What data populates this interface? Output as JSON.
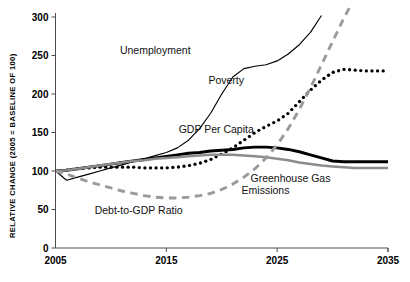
{
  "chart_data": {
    "type": "line",
    "title": "",
    "xlabel": "",
    "ylabel": "RELATIVE CHANGE (2005 = BASELINE OF 100)",
    "xlim": [
      2005,
      2035
    ],
    "ylim": [
      0,
      310
    ],
    "xticks": [
      "2005",
      "2015",
      "2025",
      "2035"
    ],
    "xtick_values": [
      2005,
      2015,
      2025,
      2035
    ],
    "yticks": [
      "0",
      "50",
      "100",
      "150",
      "200",
      "250",
      "300"
    ],
    "ytick_values": [
      0,
      50,
      100,
      150,
      200,
      250,
      300
    ],
    "grid": false,
    "legend": "inline-labels",
    "x": [
      2005,
      2006,
      2007,
      2008,
      2009,
      2010,
      2011,
      2012,
      2013,
      2014,
      2015,
      2016,
      2017,
      2018,
      2019,
      2020,
      2021,
      2022,
      2023,
      2024,
      2025,
      2026,
      2027,
      2028,
      2029,
      2030,
      2031,
      2032,
      2033,
      2034,
      2035
    ],
    "series": [
      {
        "name": "Unemployment",
        "style": "thin-solid",
        "color": "#000000",
        "label_x": 2014.0,
        "label_y": 252,
        "values": [
          100,
          88,
          92,
          96,
          100,
          104,
          108,
          112,
          116,
          120,
          124,
          130,
          140,
          155,
          175,
          200,
          222,
          233,
          236,
          238,
          243,
          252,
          264,
          280,
          302,
          null,
          null,
          null,
          null,
          null,
          null
        ]
      },
      {
        "name": "Poverty",
        "style": "dotted",
        "color": "#000000",
        "label_x": 2020.4,
        "label_y": 213,
        "values": [
          100,
          101,
          103,
          104,
          105,
          105,
          105,
          105,
          104,
          104,
          104,
          105,
          107,
          110,
          115,
          122,
          130,
          140,
          150,
          158,
          165,
          175,
          190,
          205,
          218,
          228,
          232,
          231,
          230,
          230,
          230
        ]
      },
      {
        "name": "GDP Per Capita",
        "style": "thick-solid",
        "color": "#000000",
        "label_x": 2019.5,
        "label_y": 150,
        "values": [
          100,
          101,
          103,
          105,
          107,
          109,
          111,
          113,
          115,
          117,
          119,
          121,
          123,
          124,
          126,
          127,
          128,
          130,
          131,
          131,
          130,
          128,
          125,
          121,
          117,
          113,
          112,
          112,
          112,
          112,
          112
        ]
      },
      {
        "name": "Greenhouse Gas Emissions",
        "style": "thick-solid-gray",
        "color": "#8c8c8c",
        "label_x": 2026.2,
        "label_y": 86,
        "values": [
          100,
          101,
          103,
          105,
          107,
          109,
          111,
          113,
          114,
          116,
          117,
          118,
          119,
          120,
          121,
          121,
          121,
          120,
          119,
          118,
          116,
          114,
          111,
          109,
          107,
          106,
          105,
          104,
          104,
          104,
          104
        ]
      },
      {
        "name": "Debt-to-GDP Ratio",
        "style": "dashed-gray",
        "color": "#9a9a9a",
        "label_x": 2012.5,
        "label_y": 44,
        "values": [
          100,
          96,
          91,
          86,
          82,
          78,
          74,
          71,
          68,
          66,
          65,
          65,
          66,
          68,
          71,
          76,
          83,
          92,
          103,
          117,
          134,
          155,
          180,
          208,
          238,
          268,
          298,
          325,
          352,
          378,
          404
        ]
      }
    ]
  },
  "axis": {
    "y_title": "RELATIVE CHANGE (2005 = BASELINE OF 100)"
  },
  "labels": {
    "unemployment": "Unemployment",
    "poverty": "Poverty",
    "gdp_per_capita": "GDP Per Capita",
    "greenhouse": "Greenhouse Gas",
    "greenhouse2": "Emissions",
    "debt": "Debt-to-GDP Ratio"
  }
}
